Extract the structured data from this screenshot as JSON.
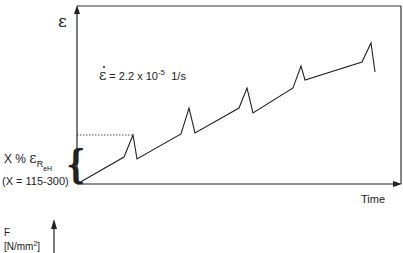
{
  "diagram": {
    "y_axis_symbol": "ε",
    "x_axis_label": "Time",
    "strain_rate": {
      "symbol": "ε̇",
      "equals": "= 2.2 x 10",
      "exponent": "-5",
      "unit": "1/s"
    },
    "preload_label": {
      "prefix": "X %",
      "symbol": "ε",
      "subscript_main": "R",
      "subscript_sub": "eH"
    },
    "range_label": "(X = 115-300)",
    "second_axis": {
      "symbol": "F",
      "unit_prefix": "[N/mm",
      "unit_exp": "2",
      "unit_suffix": "]"
    },
    "colors": {
      "line": "#222222",
      "frame": "#333333",
      "background": "#ffffff"
    },
    "curve_points": [
      [
        77,
        184
      ],
      [
        124,
        157
      ],
      [
        133,
        135
      ],
      [
        137,
        159
      ],
      [
        181,
        134
      ],
      [
        189,
        108
      ],
      [
        195,
        133
      ],
      [
        239,
        108
      ],
      [
        247,
        88
      ],
      [
        253,
        113
      ],
      [
        293,
        88
      ],
      [
        301,
        66
      ],
      [
        305,
        80
      ],
      [
        362,
        62
      ],
      [
        371,
        43
      ],
      [
        375,
        72
      ]
    ],
    "preload_level_y": 135
  }
}
